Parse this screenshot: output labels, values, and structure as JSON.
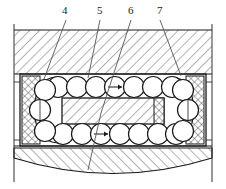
{
  "figure": {
    "kind": "engineering-cross-section",
    "background_color": "#ffffff",
    "line_color": "#1a1a1a",
    "hatch_color": "#555555",
    "width": 226,
    "height": 189
  },
  "callouts": [
    {
      "id": "4",
      "label": "4",
      "x": 64,
      "y": 6,
      "leader_from": [
        66,
        20
      ],
      "leader_to": [
        44,
        79
      ],
      "target": "left-outer-race"
    },
    {
      "id": "5",
      "label": "5",
      "x": 99,
      "y": 6,
      "leader_from": [
        100,
        20
      ],
      "leader_to": [
        88,
        78
      ],
      "target": "upper-ball-row"
    },
    {
      "id": "6",
      "label": "6",
      "x": 130,
      "y": 6,
      "leader_from": [
        131,
        20
      ],
      "leader_to": [
        101,
        113
      ],
      "target": "inner-race"
    },
    {
      "id": "7",
      "label": "7",
      "x": 159,
      "y": 6,
      "leader_from": [
        160,
        20
      ],
      "leader_to": [
        181,
        76
      ],
      "target": "right-outer-race"
    }
  ],
  "regions": {
    "upper_housing": {
      "name": "upper housing",
      "hatch": "diagonal-45",
      "x": 10,
      "y": 30,
      "w": 206,
      "h": 44
    },
    "lower_housing": {
      "name": "lower housing",
      "hatch": "diagonal-45",
      "x": 10,
      "y": 148,
      "w": 206,
      "h": 30,
      "bottom_arc": true
    },
    "left_race": {
      "name": "left outer race",
      "hatch": "cross-hatch",
      "x": 22,
      "y": 76,
      "w": 18,
      "h": 66
    },
    "right_race": {
      "name": "right outer race",
      "hatch": "cross-hatch",
      "x": 186,
      "y": 76,
      "w": 18,
      "h": 66
    },
    "inner_race": {
      "name": "inner race",
      "hatch": "diagonal-45",
      "x": 62,
      "y": 98,
      "w": 102,
      "h": 26
    },
    "inner_race_cap": {
      "name": "inner race end cap",
      "hatch": "cross-hatch",
      "x": 156,
      "y": 98,
      "w": 8,
      "h": 26
    }
  },
  "balls": {
    "name": "rolling elements",
    "radius": 10.5,
    "upper_row_y": 87,
    "lower_row_y": 134,
    "upper_row_x": [
      58,
      77,
      96,
      115,
      134,
      153,
      172
    ],
    "lower_row_x": [
      63,
      82,
      101,
      120,
      139,
      158,
      176
    ],
    "left_arc": [
      [
        44,
        80
      ],
      [
        38,
        100
      ],
      [
        38,
        121
      ],
      [
        46,
        138
      ]
    ],
    "right_arc": [
      [
        182,
        80
      ],
      [
        189,
        100
      ],
      [
        189,
        121
      ],
      [
        181,
        138
      ]
    ],
    "center_marks": [
      [
        115,
        87
      ],
      [
        101,
        134
      ]
    ]
  },
  "frame": {
    "outer_left_x": 14,
    "outer_right_x": 212,
    "top_y": 24,
    "bottom_y": 182,
    "housing_inner_top_y": 74,
    "housing_inner_bottom_y": 146
  }
}
